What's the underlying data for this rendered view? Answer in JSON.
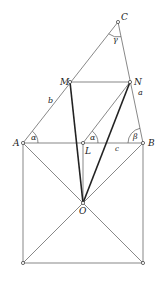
{
  "figure": {
    "points": {
      "C": {
        "label": "C",
        "x": 118,
        "y": 22
      },
      "M": {
        "label": "M",
        "x": 70,
        "y": 82
      },
      "N": {
        "label": "N",
        "x": 130,
        "y": 82
      },
      "A": {
        "label": "A",
        "x": 23,
        "y": 143
      },
      "L": {
        "label": "L",
        "x": 83,
        "y": 143
      },
      "B": {
        "label": "B",
        "x": 143,
        "y": 143
      },
      "O": {
        "label": "O",
        "x": 83,
        "y": 203
      },
      "BL": {
        "label": "",
        "x": 23,
        "y": 263
      },
      "BR": {
        "label": "",
        "x": 143,
        "y": 263
      }
    },
    "side_labels": {
      "a": "a",
      "b": "b",
      "c": "c"
    },
    "angle_labels": {
      "alpha_A": "α",
      "alpha_L": "α",
      "beta": "β",
      "gamma": "γ"
    }
  }
}
